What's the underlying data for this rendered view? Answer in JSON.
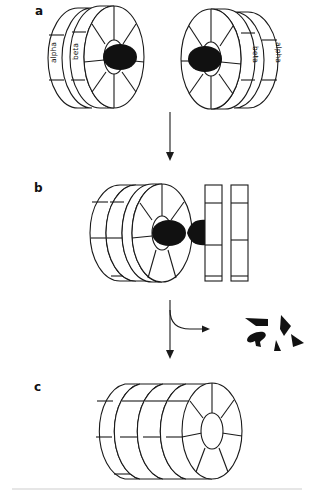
{
  "figure": {
    "panels": [
      {
        "id": "a",
        "label": "a",
        "description": "Two separate proteasome halves each with an alpha ring and beta ring, substrate (black) bound at inner face",
        "ring_labels": [
          "alpha",
          "beta"
        ]
      },
      {
        "id": "b",
        "label": "b",
        "description": "Halves assembled with substrate protein being threaded through; outer rings shown as separate bars"
      },
      {
        "id": "c",
        "label": "c",
        "description": "Fully assembled cylindrical complex of stacked rings with central pore"
      }
    ],
    "arrows": [
      {
        "from": "a",
        "to": "b",
        "type": "straight-down"
      },
      {
        "from": "b",
        "to": "c",
        "type": "straight-down-with-branch",
        "branch_product": "peptide fragments"
      }
    ],
    "fragment_count": 5,
    "colors": {
      "line": "#1a1a1a",
      "fill_dark": "#111111",
      "background": "#ffffff"
    }
  }
}
